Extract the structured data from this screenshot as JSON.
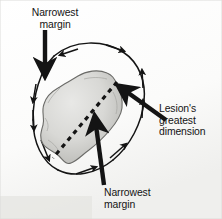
{
  "figure": {
    "type": "medical-illustration",
    "labels": {
      "narrowest_margin_top": "Narrowest\nmargin",
      "lesion_greatest_dimension": "Lesion's\ngreatest\ndimension",
      "narrowest_margin_bottom": "Narrowest\nmargin"
    },
    "colors": {
      "background": "#fdfdfc",
      "ink": "#141414",
      "lesion_fill": "#d6d6d4",
      "lesion_shadow": "#a9a9a6",
      "lesion_outline": "#4a4a48"
    },
    "elements": {
      "excision_ellipse": "tilted oval outline with directional arrowheads indicating margin boundary",
      "lesion_blob": "irregular gray lobulated lesion at center",
      "dashed_axis": "dashed line across the lesion marking its greatest dimension",
      "pointer_top": "thick vertical arrow pointing down to upper margin",
      "pointer_right": "thick arrow pointing up-left to lesion tip",
      "pointer_bottom": "thick arrow pointing up to lower margin"
    }
  }
}
